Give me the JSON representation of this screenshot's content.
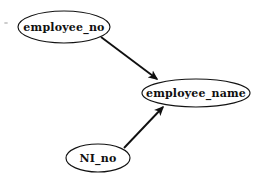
{
  "diagram": {
    "type": "functional-dependency-graph",
    "background_color": "#ffffff",
    "stroke_color": "#101010",
    "nodes": [
      {
        "id": "employee_no",
        "label": "employee_no",
        "shape": "ellipse",
        "cx": 64,
        "cy": 27,
        "rx": 46,
        "ry": 16,
        "font_size": 11
      },
      {
        "id": "employee_name",
        "label": "employee_name",
        "shape": "ellipse",
        "cx": 196,
        "cy": 93,
        "rx": 54,
        "ry": 14,
        "font_size": 11
      },
      {
        "id": "NI_no",
        "label": "NI_no",
        "shape": "ellipse",
        "cx": 98,
        "cy": 158,
        "rx": 32,
        "ry": 14,
        "font_size": 11
      }
    ],
    "edges": [
      {
        "id": "edge-employee-no-to-employee-name",
        "from": "employee_no",
        "to": "employee_name",
        "directed": true,
        "x1": 101,
        "y1": 37,
        "x2": 157,
        "y2": 79
      },
      {
        "id": "edge-ni-no-to-employee-name",
        "from": "NI_no",
        "to": "employee_name",
        "directed": true,
        "x1": 124,
        "y1": 148,
        "x2": 163,
        "y2": 107
      }
    ],
    "artifacts": [
      {
        "id": "scan-speck",
        "cx": 6,
        "cy": 23,
        "w": 4,
        "h": 2
      }
    ]
  }
}
